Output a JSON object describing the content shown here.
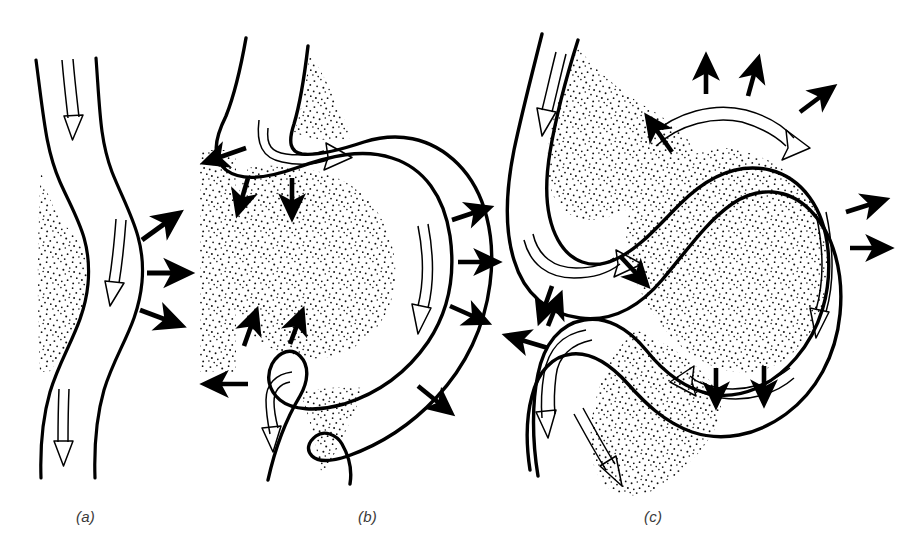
{
  "figure": {
    "background_color": "#ffffff",
    "ink_color": "#000000",
    "stipple_color": "#1a1a1a",
    "width": 899,
    "height": 558
  },
  "panels": [
    {
      "id": "a",
      "label": "(a)",
      "caption_x": 76,
      "caption_y": 508,
      "stage": "gentle sinuous flow",
      "description": "Nearly zonal jet with small-amplitude wave; cold stippled air confined to the west of the channel.",
      "flow_arrows": 3,
      "outward_arrows": 3,
      "stipple_regions": 1
    },
    {
      "id": "b",
      "label": "(b)",
      "caption_x": 358,
      "caption_y": 508,
      "stage": "amplifying wave",
      "description": "Large-amplitude trough; cold stippled air surges equatorward into the bulge while warm air is pushed outward on the east flank.",
      "flow_arrows": 4,
      "outward_arrows": 9,
      "stipple_regions": 3
    },
    {
      "id": "c",
      "label": "(c)",
      "caption_x": 644,
      "caption_y": 508,
      "stage": "cut-off / omega block",
      "description": "Fully developed closed meander enclosing a pool of cold stippled air; flow wraps around the isolated cell.",
      "flow_arrows": 5,
      "outward_arrows": 12,
      "stipple_regions": 3
    }
  ],
  "legend_semantics": {
    "open_double_arrow": "direction of jet-stream flow",
    "solid_black_arrow": "direction of air-mass displacement / outflow",
    "stippled_area": "cold air mass"
  }
}
